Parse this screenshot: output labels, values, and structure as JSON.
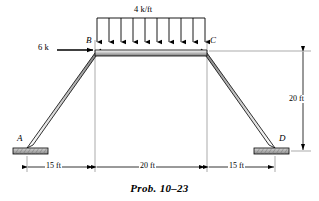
{
  "figure": {
    "caption": "Prob. 10–23",
    "joints": [
      {
        "name": "A",
        "label": "A",
        "x": 27,
        "y": 148,
        "support": "fixed-plate"
      },
      {
        "name": "B",
        "label": "B",
        "x": 95,
        "y": 50,
        "support": "none"
      },
      {
        "name": "C",
        "label": "C",
        "x": 207,
        "y": 50,
        "support": "none"
      },
      {
        "name": "D",
        "label": "D",
        "x": 275,
        "y": 148,
        "support": "fixed-plate"
      }
    ],
    "members": [
      {
        "name": "member-AB",
        "from": "A",
        "to": "B"
      },
      {
        "name": "member-BC",
        "from": "B",
        "to": "C"
      },
      {
        "name": "member-CD",
        "from": "C",
        "to": "D"
      }
    ],
    "loads": {
      "distributed": {
        "label": "4 k/ft",
        "magnitude": 4,
        "unit": "k/ft",
        "applied_to": "member-BC",
        "direction": "down",
        "arrow_count": 10
      },
      "point": {
        "label": "6 k",
        "magnitude": 6,
        "unit": "k",
        "applied_to": "B",
        "direction": "right"
      }
    },
    "dimensions": {
      "horizontal": [
        {
          "label": "15 ft",
          "value": 15,
          "unit": "ft",
          "span": "A-B"
        },
        {
          "label": "20 ft",
          "value": 20,
          "unit": "ft",
          "span": "B-C"
        },
        {
          "label": "15 ft",
          "value": 15,
          "unit": "ft",
          "span": "C-D"
        }
      ],
      "vertical": [
        {
          "label": "20 ft",
          "value": 20,
          "unit": "ft",
          "span": "C-D-height"
        }
      ]
    },
    "colors": {
      "line": "#000000",
      "member_fill_light": "#ffffff",
      "member_fill_mid": "#c8c8c8",
      "member_fill_dark": "#8a8a8a",
      "support_fill": "#b0b0b0",
      "background": "#ffffff"
    }
  }
}
